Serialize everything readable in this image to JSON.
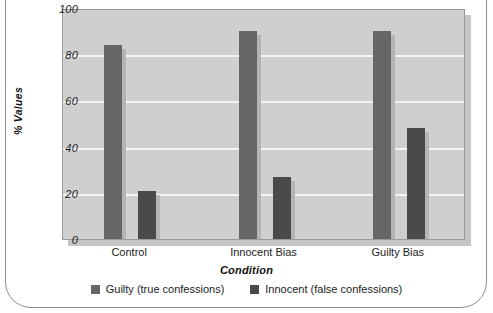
{
  "chart_data": {
    "type": "bar",
    "title": "",
    "subtitle": "",
    "xlabel": "Condition",
    "ylabel": "% Values",
    "categories": [
      "Control",
      "Innocent Bias",
      "Guilty Bias"
    ],
    "series": [
      {
        "name": "Guilty (true confessions)",
        "values": [
          84,
          90,
          90
        ],
        "color": "#666666"
      },
      {
        "name": "Innocent (false confessions)",
        "values": [
          21,
          27,
          48
        ],
        "color": "#4a4a4a"
      }
    ],
    "ylim": [
      0,
      100
    ],
    "yticks": [
      0,
      20,
      40,
      60,
      80,
      100
    ],
    "ytick_labels": [
      "0",
      "20",
      "40",
      "60",
      "80",
      "100"
    ],
    "gridlines": [
      20,
      40,
      60,
      80
    ],
    "grid": true,
    "grid_color": "#f4f4f4",
    "plot_background": "#cfcfcf",
    "legend_position": "bottom"
  },
  "axis": {
    "y_title": "% Values",
    "x_title": "Condition",
    "y_ticks": [
      {
        "value": "100"
      },
      {
        "value": "80"
      },
      {
        "value": "60"
      },
      {
        "value": "40"
      },
      {
        "value": "20"
      },
      {
        "value": "0"
      }
    ],
    "x_ticks": [
      {
        "label": "Control"
      },
      {
        "label": "Innocent Bias"
      },
      {
        "label": "Guilty Bias"
      }
    ]
  },
  "legend": {
    "items": [
      {
        "label": "Guilty (true confessions)",
        "color": "#666666",
        "swatch": "legend-swatch-square"
      },
      {
        "label": "Innocent (false confessions)",
        "color": "#4a4a4a",
        "swatch": "legend-swatch-square"
      }
    ]
  },
  "colors": {
    "series_guilty": "#666666",
    "series_innocent": "#4a4a4a",
    "plot_bg": "#cfcfcf",
    "grid": "#f4f4f4",
    "frame": "#8e8e8e",
    "text": "#1c1c1c"
  }
}
